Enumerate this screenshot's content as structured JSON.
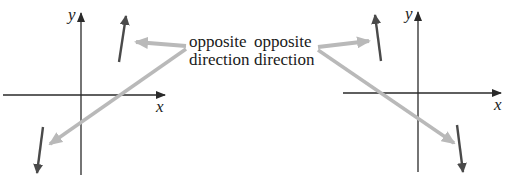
{
  "diagram": {
    "colors": {
      "axis": "#2a2a2a",
      "vector": "#4a4a4a",
      "pointer": "#b9b9b9",
      "text": "#1a1a1a"
    },
    "left_panel": {
      "axis_x_label": "x",
      "axis_y_label": "y",
      "vectors": [
        {
          "name": "up-vector",
          "from": [
            119,
            62
          ],
          "to": [
            126,
            16
          ]
        },
        {
          "name": "down-vector",
          "from": [
            43,
            127
          ],
          "to": [
            37,
            173
          ]
        }
      ]
    },
    "right_panel": {
      "axis_x_label": "x",
      "axis_y_label": "y",
      "vectors": [
        {
          "name": "up-vector",
          "from": [
            381,
            61
          ],
          "to": [
            375,
            15
          ]
        },
        {
          "name": "down-vector",
          "from": [
            457,
            125
          ],
          "to": [
            463,
            172
          ]
        }
      ]
    },
    "annotations": [
      {
        "line1": "opposite",
        "line2": "direction"
      },
      {
        "line1": "opposite",
        "line2": "direction"
      }
    ]
  }
}
